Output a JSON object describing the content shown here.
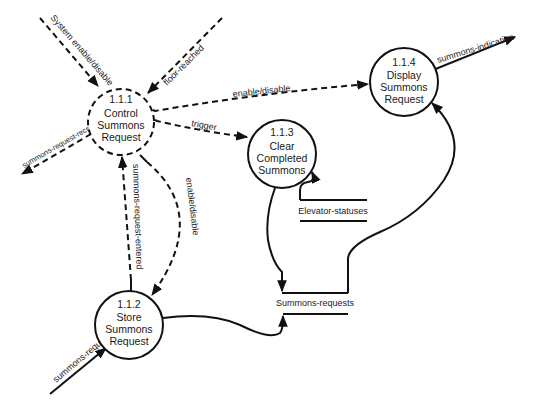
{
  "diagram": {
    "type": "data-flow-diagram",
    "colors": {
      "ink": "#111111",
      "background": "#ffffff"
    },
    "processes": [
      {
        "id": "1.1.1",
        "number": "1.1.1",
        "lines": [
          "Control",
          "Summons",
          "Request"
        ],
        "style": "dashed"
      },
      {
        "id": "1.1.2",
        "number": "1.1.2",
        "lines": [
          "Store",
          "Summons",
          "Request"
        ],
        "style": "solid"
      },
      {
        "id": "1.1.3",
        "number": "1.1.3",
        "lines": [
          "Clear",
          "Completed",
          "Summons"
        ],
        "style": "solid"
      },
      {
        "id": "1.1.4",
        "number": "1.1.4",
        "lines": [
          "Display",
          "Summons",
          "Request"
        ],
        "style": "solid"
      }
    ],
    "stores": [
      {
        "id": "elevator-statuses",
        "label": "Elevator-statuses"
      },
      {
        "id": "summons-requests",
        "label": "Summons-requests"
      }
    ],
    "flows": [
      {
        "label": "System enable/disable",
        "from": "external",
        "to": "1.1.1",
        "style": "dashed"
      },
      {
        "label": "floor-reached",
        "from": "external",
        "to": "1.1.1",
        "style": "dashed"
      },
      {
        "label": "summons-request-received",
        "from": "1.1.1",
        "to": "external",
        "style": "dashed"
      },
      {
        "label": "enable/disable",
        "from": "1.1.1",
        "to": "1.1.4",
        "style": "dashed"
      },
      {
        "label": "trigger",
        "from": "1.1.1",
        "to": "1.1.3",
        "style": "dashed"
      },
      {
        "label": "summons-request-entered",
        "from": "1.1.2",
        "to": "1.1.1",
        "style": "dashed"
      },
      {
        "label": "enable/disable",
        "from": "1.1.1",
        "to": "1.1.2",
        "style": "dashed"
      },
      {
        "label": "summons-request",
        "from": "external",
        "to": "1.1.2",
        "style": "solid"
      },
      {
        "label": "summons-indication",
        "from": "1.1.4",
        "to": "external",
        "style": "solid"
      },
      {
        "label": "",
        "from": "elevator-statuses",
        "to": "1.1.3",
        "style": "solid"
      },
      {
        "label": "",
        "from": "1.1.3",
        "to": "summons-requests",
        "style": "solid"
      },
      {
        "label": "",
        "from": "1.1.2",
        "to": "summons-requests",
        "style": "solid"
      },
      {
        "label": "",
        "from": "summons-requests",
        "to": "1.1.4",
        "style": "solid"
      }
    ]
  }
}
